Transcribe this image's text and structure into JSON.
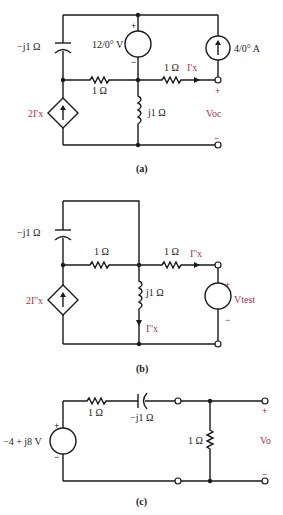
{
  "circuits": [
    {
      "id": "a",
      "caption": "(a)",
      "labels": {
        "capacitor": "−j1 Ω",
        "voltage_source": "12/0° V",
        "current_source": "4/0° A",
        "resistor_left": "1 Ω",
        "resistor_right": "1 Ω",
        "inductor": "j1 Ω",
        "dependent_source": "2I'x",
        "current_label": "I'x",
        "output_voltage": "Voc",
        "plus": "+",
        "minus": "−"
      }
    },
    {
      "id": "b",
      "caption": "(b)",
      "labels": {
        "capacitor": "−j1 Ω",
        "resistor_left": "1 Ω",
        "resistor_right": "1 Ω",
        "inductor": "j1 Ω",
        "dependent_source": "2I''x",
        "current_label_right": "I''x",
        "current_label_inductor": "I''x",
        "test_voltage": "Vtest",
        "plus": "+",
        "minus": "−"
      }
    },
    {
      "id": "c",
      "caption": "(c)",
      "labels": {
        "voltage_source": "−4 + j8 V",
        "resistor_series": "1 Ω",
        "capacitor": "−j1 Ω",
        "resistor_load": "1 Ω",
        "output_voltage": "Vo",
        "plus": "+",
        "minus": "−"
      }
    }
  ],
  "colors": {
    "wire": "#1a1a1a",
    "accent_label": "#a8324a"
  }
}
